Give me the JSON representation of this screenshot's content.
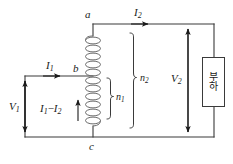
{
  "diagram": {
    "kind": "autotransformer-circuit-schematic",
    "nodes": {
      "a": "a",
      "b": "b",
      "c": "c"
    },
    "currents": {
      "i1": {
        "symbol": "I",
        "subscript": "1"
      },
      "i2": {
        "symbol": "I",
        "subscript": "2"
      },
      "i1_minus_i2": {
        "first": "I",
        "first_sub": "1",
        "operator": "−",
        "second": "I",
        "second_sub": "2"
      }
    },
    "voltages": {
      "v1": {
        "symbol": "V",
        "subscript": "1"
      },
      "v2": {
        "symbol": "V",
        "subscript": "2"
      }
    },
    "turns": {
      "n1": {
        "symbol": "n",
        "subscript": "1"
      },
      "n2": {
        "symbol": "n",
        "subscript": "2"
      }
    },
    "load": {
      "label_line1": "부",
      "label_line2": "하"
    },
    "colors": {
      "wire": "#3a3a3a",
      "coil": "#6b6b6b",
      "text": "#1a1a1a",
      "background": "#ffffff",
      "arrow": "#1a1a1a"
    },
    "coil": {
      "turns_total": 11,
      "turns_below_tap": 7
    }
  }
}
